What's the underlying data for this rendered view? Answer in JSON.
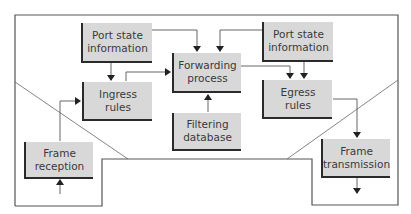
{
  "diagram": {
    "type": "block-diagram",
    "nodes": [
      {
        "id": "port_state_left",
        "label": "Port state\ninformation"
      },
      {
        "id": "ingress_rules",
        "label": "Ingress\nrules"
      },
      {
        "id": "forwarding_process",
        "label": "Forwarding\nprocess"
      },
      {
        "id": "filtering_database",
        "label": "Filtering\ndatabase"
      },
      {
        "id": "port_state_right",
        "label": "Port state\ninformation"
      },
      {
        "id": "egress_rules",
        "label": "Egress\nrules"
      },
      {
        "id": "frame_reception",
        "label": "Frame\nreception"
      },
      {
        "id": "frame_transmission",
        "label": "Frame\ntransmission"
      }
    ],
    "edges": [
      {
        "from": "external_in",
        "to": "frame_reception"
      },
      {
        "from": "frame_reception",
        "to": "ingress_rules"
      },
      {
        "from": "port_state_left",
        "to": "ingress_rules"
      },
      {
        "from": "port_state_left",
        "to": "forwarding_process"
      },
      {
        "from": "ingress_rules",
        "to": "forwarding_process"
      },
      {
        "from": "port_state_right",
        "to": "forwarding_process"
      },
      {
        "from": "filtering_database",
        "to": "forwarding_process"
      },
      {
        "from": "forwarding_process",
        "to": "egress_rules"
      },
      {
        "from": "port_state_right",
        "to": "egress_rules"
      },
      {
        "from": "egress_rules",
        "to": "frame_transmission"
      },
      {
        "from": "frame_transmission",
        "to": "external_out"
      }
    ],
    "colors": {
      "box_fill": "#d8d8d8",
      "box_shadow_border": "#2a2a2a",
      "line": "#444444",
      "text": "#3a3a3a"
    }
  }
}
